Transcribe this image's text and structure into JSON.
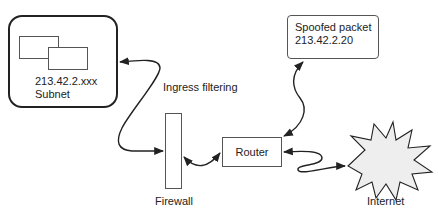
{
  "diagram": {
    "nodes": {
      "subnet": {
        "address": "213.42.2.xxx",
        "label": "Subnet",
        "icon": "network-hosts-icon"
      },
      "firewall": {
        "label": "Firewall"
      },
      "router": {
        "label": "Router"
      },
      "spoofed_packet": {
        "line1": "Spoofed packet",
        "line2": "213.42.2.20"
      },
      "internet": {
        "label": "Internet",
        "icon": "cloud-burst-icon"
      }
    },
    "annotations": {
      "ingress": "Ingress filtering"
    },
    "edges": [
      {
        "from": "firewall",
        "to": "subnet",
        "bidirectional": true
      },
      {
        "from": "firewall",
        "to": "router",
        "bidirectional": true
      },
      {
        "from": "spoofed_packet",
        "to": "router",
        "bidirectional": true
      },
      {
        "from": "router",
        "to": "internet",
        "bidirectional": true
      }
    ],
    "colors": {
      "stroke": "#222222",
      "internet_fill": "#eeeeee",
      "background": "#ffffff"
    }
  }
}
